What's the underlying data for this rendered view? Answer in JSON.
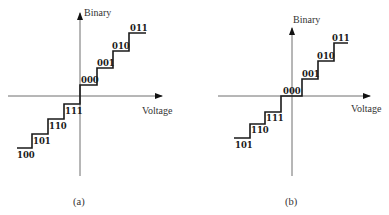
{
  "diagrams": [
    {
      "id": "a",
      "caption": "(a)",
      "y_axis_label": "Binary",
      "x_axis_label": "Voltage",
      "codes_positive": [
        "000",
        "001",
        "010",
        "011"
      ],
      "codes_negative": [
        "111",
        "110",
        "101",
        "100"
      ]
    },
    {
      "id": "b",
      "caption": "(b)",
      "y_axis_label": "Binary",
      "x_axis_label": "Voltage",
      "codes_center": "000",
      "codes_positive": [
        "001",
        "010",
        "011"
      ],
      "codes_negative": [
        "111",
        "110",
        "101"
      ]
    }
  ],
  "colors": {
    "axis": "#6e6e6e",
    "staircase": "#1a1a1a",
    "text": "#333333"
  }
}
